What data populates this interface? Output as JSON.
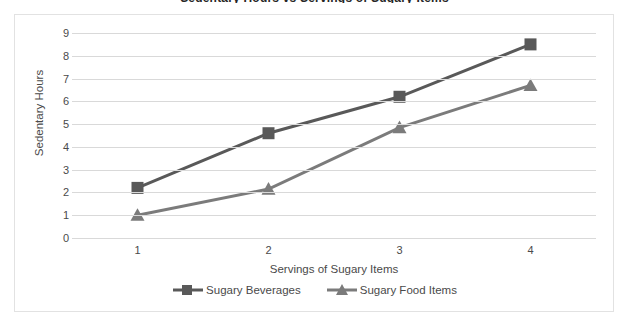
{
  "title_remnant": "Sedentary Hours vs Servings of Sugary Items",
  "chart_data": {
    "type": "line",
    "title": "",
    "xlabel": "Servings of Sugary Items",
    "ylabel": "Sedentary Hours",
    "x": [
      1,
      2,
      3,
      4
    ],
    "categories": [
      "1",
      "2",
      "3",
      "4"
    ],
    "xtick_labels": [
      "1",
      "2",
      "3",
      "4"
    ],
    "ytick_labels": [
      "0",
      "1",
      "2",
      "3",
      "4",
      "5",
      "6",
      "7",
      "8",
      "9"
    ],
    "ylim": [
      0,
      9
    ],
    "xlim": [
      0.5,
      4.5
    ],
    "grid": "horizontal",
    "legend_position": "bottom",
    "series": [
      {
        "name": "Sugary Beverages",
        "marker": "square",
        "color": "#595959",
        "values": [
          2.2,
          4.6,
          6.2,
          8.5
        ]
      },
      {
        "name": "Sugary Food Items",
        "marker": "triangle",
        "color": "#7b7b7b",
        "values": [
          1.0,
          2.15,
          4.85,
          6.7
        ]
      }
    ]
  },
  "legend": {
    "items": [
      {
        "label": "Sugary Beverages",
        "marker": "square-marker",
        "color": "#595959"
      },
      {
        "label": "Sugary Food Items",
        "marker": "triangle-marker",
        "color": "#7b7b7b"
      }
    ]
  },
  "colors": {
    "series_1": "#595959",
    "series_2": "#7b7b7b",
    "gridline": "#d9d9d9",
    "frame": "#e2e2e2",
    "text": "#4a4a4a"
  }
}
